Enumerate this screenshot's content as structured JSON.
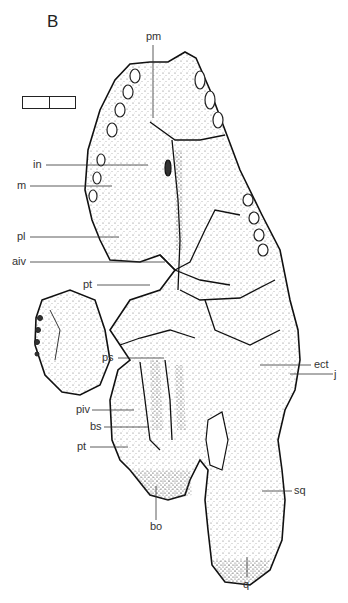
{
  "figure": {
    "panel_letter": "B",
    "scale_bar": {
      "segments": 2
    },
    "labels": [
      {
        "id": "pm",
        "text": "pm"
      },
      {
        "id": "in",
        "text": "in"
      },
      {
        "id": "m",
        "text": "m"
      },
      {
        "id": "pl",
        "text": "pl"
      },
      {
        "id": "aiv",
        "text": "aiv"
      },
      {
        "id": "pt1",
        "text": "pt"
      },
      {
        "id": "ps",
        "text": "ps"
      },
      {
        "id": "ect",
        "text": "ect"
      },
      {
        "id": "j",
        "text": "j"
      },
      {
        "id": "piv",
        "text": "piv"
      },
      {
        "id": "bs",
        "text": "bs"
      },
      {
        "id": "pt2",
        "text": "pt"
      },
      {
        "id": "bo",
        "text": "bo"
      },
      {
        "id": "sq",
        "text": "sq"
      },
      {
        "id": "q",
        "text": "q"
      }
    ]
  }
}
